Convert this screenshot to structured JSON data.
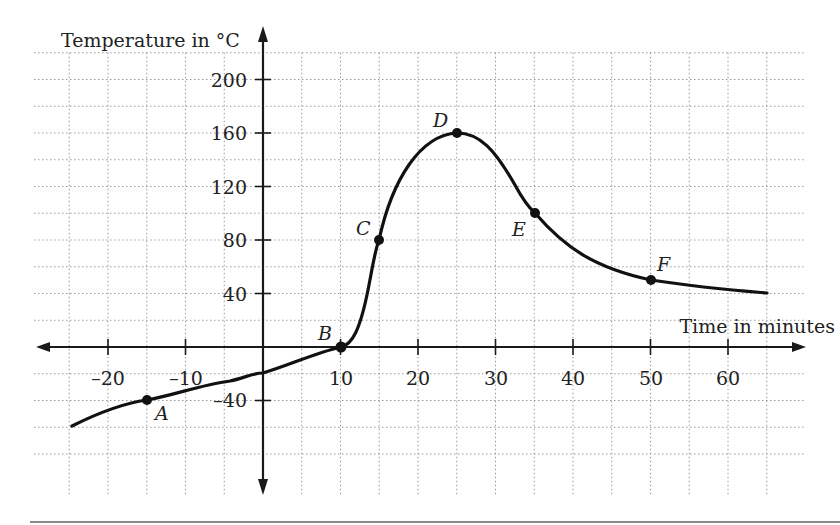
{
  "chart_data": {
    "type": "line",
    "title": "",
    "xlabel": "Time in minutes",
    "ylabel": "Temperature in °C",
    "xlim": [
      -25,
      65
    ],
    "ylim": [
      -80,
      220
    ],
    "grid": true,
    "grid_x_step": 5,
    "grid_y_step": 20,
    "x_ticks": [
      -20,
      -10,
      10,
      20,
      30,
      40,
      50,
      60
    ],
    "x_tick_labels": [
      "–20",
      "–10",
      "10",
      "20",
      "30",
      "40",
      "50",
      "60"
    ],
    "y_ticks": [
      200,
      160,
      120,
      80,
      40,
      -40
    ],
    "y_tick_labels": [
      "200",
      "160",
      "120",
      "80",
      "40",
      "–40"
    ],
    "series": [
      {
        "name": "Temperature",
        "x": [
          -25,
          -20,
          -15,
          -10,
          -5,
          0,
          5,
          10,
          12,
          15,
          18,
          20,
          25,
          30,
          35,
          40,
          45,
          50,
          55,
          60,
          65
        ],
        "y": [
          -60,
          -48,
          -40,
          -34,
          -28,
          -20,
          -10,
          0,
          12,
          80,
          130,
          148,
          160,
          140,
          100,
          72,
          57,
          50,
          47,
          44,
          41
        ]
      }
    ],
    "labeled_points": [
      {
        "label": "A",
        "x": -15,
        "y": -40
      },
      {
        "label": "B",
        "x": 10,
        "y": 0
      },
      {
        "label": "C",
        "x": 15,
        "y": 80
      },
      {
        "label": "D",
        "x": 25,
        "y": 160
      },
      {
        "label": "E",
        "x": 35,
        "y": 100
      },
      {
        "label": "F",
        "x": 50,
        "y": 50
      }
    ],
    "legend": null
  },
  "labels": {
    "y_axis_title": "Temperature in °C",
    "x_axis_title": "Time in minutes",
    "point_A": "A",
    "point_B": "B",
    "point_C": "C",
    "point_D": "D",
    "point_E": "E",
    "point_F": "F",
    "tick_x_m20": "–20",
    "tick_x_m10": "–10",
    "tick_x_10": "10",
    "tick_x_20": "20",
    "tick_x_30": "30",
    "tick_x_40": "40",
    "tick_x_50": "50",
    "tick_x_60": "60",
    "tick_y_200": "200",
    "tick_y_160": "160",
    "tick_y_120": "120",
    "tick_y_80": "80",
    "tick_y_40": "40",
    "tick_y_m40": "–40"
  }
}
